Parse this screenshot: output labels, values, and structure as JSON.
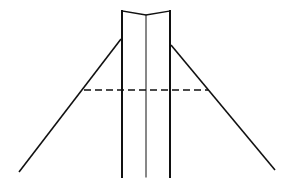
{
  "diagram": {
    "width": 295,
    "height": 189,
    "background": "#ffffff",
    "stroke_color": "#111111",
    "post": {
      "left_x": 122,
      "center_x": 146,
      "right_x": 170,
      "top_y": 11,
      "center_top_y": 15,
      "bottom_y": 177
    },
    "guy_wires": {
      "left": {
        "x1": 121,
        "y1": 39,
        "x2": 19,
        "y2": 172
      },
      "right": {
        "x1": 171,
        "y1": 45,
        "x2": 275,
        "y2": 170
      }
    },
    "dashed_line": {
      "x1": 84,
      "y1": 90,
      "x2": 208,
      "y2": 90
    }
  }
}
